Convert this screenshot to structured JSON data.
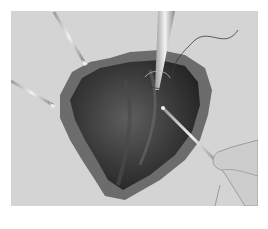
{
  "illustration": {
    "subject": "surgical illustration of an opened tissue cavity with retractors, a needle holder with suture, and a probe held by a hand",
    "palette": {
      "background": "#ffffff",
      "panel": "#d4d4d4",
      "tissue_dark": "#2e2e2e",
      "tissue_mid": "#5a5a5a",
      "tissue_rim": "#7a7a7a",
      "instrument": "#e8e8e8",
      "hand": "#cfcfcf"
    },
    "elements": [
      "retractor-top-left",
      "retractor-left",
      "needle-holder",
      "suture-thread",
      "probe",
      "hand"
    ]
  }
}
